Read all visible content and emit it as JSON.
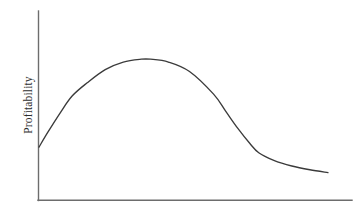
{
  "figure": {
    "background_color": "#ffffff",
    "width": 363,
    "height": 216
  },
  "axes": {
    "y_axis_label": "Profitability",
    "x_axis_label": "",
    "title": "",
    "axis_color": "#6d6d6d",
    "y_axis": {
      "x": 38,
      "y_top": 11,
      "y_bottom": 200
    },
    "x_axis": {
      "y": 200,
      "x_left": 38,
      "x_right": 352
    },
    "ticks": {
      "x": [],
      "y": []
    },
    "grid": false,
    "legend": false
  },
  "chart_data": {
    "type": "line",
    "title": "",
    "xlabel": "",
    "ylabel": "Profitability",
    "grid": false,
    "legend_position": "none",
    "line_color": "#3b3b3b",
    "xlim": [
      0,
      1
    ],
    "ylim": [
      0,
      1
    ],
    "axis_tick_labels": {
      "x": [],
      "y": []
    },
    "series": [
      {
        "name": "Profitability",
        "x": [
          0.0,
          0.03,
          0.07,
          0.11,
          0.16,
          0.22,
          0.28,
          0.34,
          0.37,
          0.43,
          0.5,
          0.58,
          0.62,
          0.66,
          0.7,
          0.73,
          0.78,
          0.84,
          0.9,
          0.96
        ],
        "y": [
          0.28,
          0.36,
          0.46,
          0.55,
          0.62,
          0.69,
          0.73,
          0.745,
          0.745,
          0.73,
          0.68,
          0.56,
          0.47,
          0.38,
          0.3,
          0.25,
          0.21,
          0.18,
          0.16,
          0.145
        ]
      }
    ],
    "pixel_path": {
      "start": [
        39,
        148
      ],
      "peak": [
        155,
        59
      ],
      "inflection": [
        232,
        118
      ],
      "knee": [
        265,
        157
      ],
      "end": [
        340,
        176
      ]
    }
  }
}
